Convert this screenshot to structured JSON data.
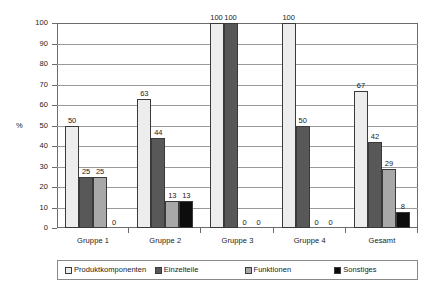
{
  "chart_data": {
    "type": "bar",
    "title": "",
    "xlabel": "",
    "ylabel": "%",
    "ylim": [
      0,
      100
    ],
    "ytick_step": 10,
    "yticks": [
      100,
      90,
      80,
      70,
      60,
      50,
      40,
      30,
      20,
      10,
      0
    ],
    "grid": true,
    "legend_position": "bottom",
    "categories": [
      "Gruppe 1",
      "Gruppe 2",
      "Gruppe 3",
      "Gruppe 4",
      "Gesamt"
    ],
    "series": [
      {
        "name": "Produktkomponenten",
        "color": "#ededed",
        "values": [
          50,
          63,
          100,
          100,
          67
        ],
        "labels": [
          "50",
          "63",
          "100",
          "100",
          "67"
        ]
      },
      {
        "name": "Einzelteile",
        "color": "#585858",
        "values": [
          25,
          44,
          100,
          50,
          42
        ],
        "labels": [
          "25",
          "44",
          "100",
          "50",
          "42"
        ]
      },
      {
        "name": "Funktionen",
        "color": "#a8a8a8",
        "values": [
          25,
          13,
          0,
          0,
          29
        ],
        "labels": [
          "25",
          "13",
          "0",
          "0",
          "29"
        ]
      },
      {
        "name": "Sonstiges",
        "color": "#0d0d0d",
        "values": [
          0,
          13,
          0,
          0,
          8
        ],
        "labels": [
          "0",
          "13",
          "0",
          "0",
          "8"
        ]
      }
    ]
  },
  "legend": {
    "items": [
      {
        "label": "Produktkomponenten",
        "color": "#ededed"
      },
      {
        "label": "Einzelteile",
        "color": "#585858"
      },
      {
        "label": "Funktionen",
        "color": "#a8a8a8"
      },
      {
        "label": "Sonstiges",
        "color": "#0d0d0d"
      }
    ]
  },
  "axis": {
    "y_title": "%"
  },
  "colors": {
    "frame": "#6b6b6b",
    "gridline": "#9a9a9a",
    "bar_outline": "#3a3a3a",
    "background": "#ffffff",
    "text": "#1a1a1a"
  }
}
